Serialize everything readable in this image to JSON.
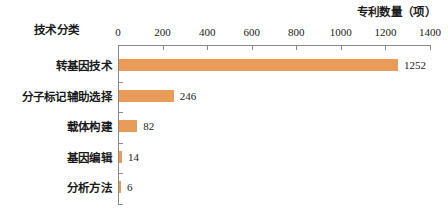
{
  "chart_data": {
    "type": "bar",
    "orientation": "horizontal",
    "title": "",
    "xlabel": "专利数量（项）",
    "ylabel": "技术分类",
    "categories": [
      "转基因技术",
      "分子标记辅助选择",
      "载体构建",
      "基因编辑",
      "分析方法"
    ],
    "values": [
      1252,
      246,
      82,
      14,
      6
    ],
    "value_labels": [
      "1252",
      "246",
      "82",
      "14",
      "6"
    ],
    "xlim": [
      0,
      1400
    ],
    "xticks": [
      0,
      200,
      400,
      600,
      800,
      1000,
      1200,
      1400
    ],
    "xtick_labels": [
      "0",
      "200",
      "400",
      "600",
      "800",
      "1000",
      "1200",
      "1400"
    ],
    "grid": false,
    "legend": false,
    "bar_color": "#e89c58",
    "axis_color": "#8a8a8a",
    "text_color": "#1a1a1a",
    "axis_position": "top"
  }
}
